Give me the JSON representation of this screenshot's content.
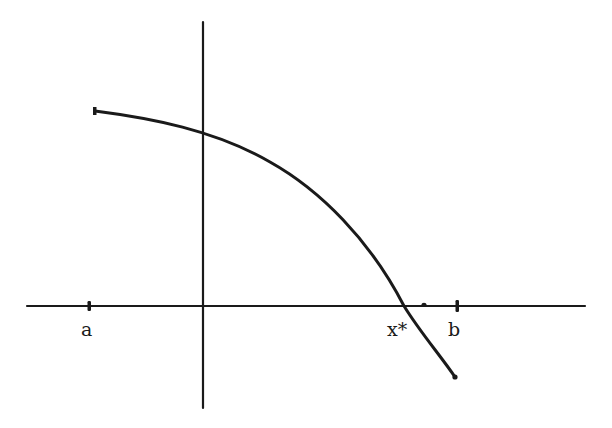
{
  "diagram": {
    "type": "function-root-plot",
    "colors": {
      "ink": "#1a1a1a",
      "background": "#ffffff"
    },
    "axes": {
      "x_axis": {
        "x1": 27,
        "x2": 585,
        "y": 306
      },
      "y_axis": {
        "x": 203,
        "y1": 22,
        "y2": 408
      }
    },
    "curve": {
      "start": {
        "x": 95,
        "y": 111
      },
      "y_intercept": {
        "x": 203,
        "y": 138
      },
      "root": {
        "x": 404,
        "y": 306
      },
      "end": {
        "x": 455,
        "y": 377
      }
    },
    "ticks": [
      {
        "name": "a",
        "x": 89
      },
      {
        "name": "small-dot",
        "x": 424
      },
      {
        "name": "b",
        "x": 457
      }
    ],
    "labels": {
      "a": "a",
      "root": "x*",
      "b": "b"
    }
  }
}
